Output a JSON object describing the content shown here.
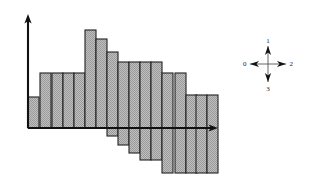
{
  "figure": {
    "title": "",
    "background_color": "#ffffff",
    "line_color": "#111111",
    "bar_fill_color": "#b3b3b3",
    "bar_edge_color": "#222222"
  },
  "axes": {
    "y_axis": {
      "name": "vertical-axis",
      "has_arrow_head": true,
      "direction": "up",
      "x": 28,
      "y_top": 14,
      "y_bottom": 128
    },
    "x_axis": {
      "name": "horizontal-axis",
      "has_arrow_head": true,
      "direction": "right",
      "y": 128,
      "x_left": 28,
      "x_right": 218
    }
  },
  "chart_data": {
    "type": "bar",
    "title": "",
    "xlabel": "",
    "ylabel": "",
    "grid": false,
    "legend": "none",
    "note": "Bars are drawn from a descending baseline; each bar has an independent top and bottom value measured in pixel units from the x-axis (positive = above axis).",
    "axis_origin_y": 128,
    "xlim": [
      28,
      218
    ],
    "ylim": [
      -50,
      115
    ],
    "categories": [
      "b1",
      "b2",
      "b3",
      "b4",
      "b5",
      "b6",
      "b7",
      "b8",
      "b9",
      "b10",
      "b11",
      "b12",
      "b13",
      "b14",
      "b15",
      "b16",
      "b17"
    ],
    "bar_left_edges": [
      28,
      40,
      52,
      63,
      74,
      85,
      96,
      107,
      118,
      129,
      140,
      151,
      162,
      175,
      186,
      196,
      207
    ],
    "bar_width": 11,
    "tops": [
      31,
      55,
      55,
      55,
      55,
      98,
      89,
      76,
      66,
      66,
      66,
      66,
      55,
      55,
      33,
      33,
      33
    ],
    "bottoms": [
      0,
      0,
      0,
      0,
      0,
      0,
      0,
      -8,
      -17,
      -25,
      -32,
      -32,
      -45,
      -45,
      -45,
      -45,
      -45
    ],
    "values": [
      31,
      55,
      55,
      55,
      55,
      98,
      89,
      84,
      83,
      91,
      98,
      98,
      100,
      100,
      78,
      78,
      78
    ]
  },
  "compass": {
    "name": "direction-rose",
    "center_x": 268,
    "center_y": 64,
    "arm_length": 18,
    "labels": {
      "up": "1",
      "right": "2",
      "down": "3",
      "left": "0"
    }
  }
}
